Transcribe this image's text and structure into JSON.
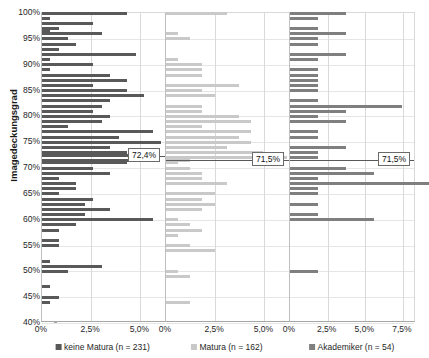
{
  "title": "",
  "chart_data": {
    "type": "bar",
    "orientation": "horizontal",
    "title": "",
    "ylabel": "Imagedeckungsgrad",
    "xlabel": "",
    "ylim": [
      40,
      100
    ],
    "y_ticks": [
      "40%",
      "45%",
      "50%",
      "55%",
      "60%",
      "65%",
      "70%",
      "75%",
      "80%",
      "85%",
      "90%",
      "95%",
      "100%"
    ],
    "grid": true,
    "legend_position": "bottom",
    "panels": [
      {
        "name": "keine Matura (n = 231)",
        "color": "#595959",
        "n": 231,
        "xlim": [
          0,
          6.25
        ],
        "x_ticks": [
          {
            "label": "0%",
            "value": 0
          },
          {
            "label": "2,5%",
            "value": 2.5
          },
          {
            "label": "5,0%",
            "value": 5.0
          }
        ],
        "mean_label": "72,4%",
        "mean_value": 72.4,
        "points": [
          {
            "y": 100.0,
            "v": 4.33
          },
          {
            "y": 99.0,
            "v": 0.43
          },
          {
            "y": 98.0,
            "v": 2.6
          },
          {
            "y": 97.0,
            "v": 0.87
          },
          {
            "y": 96.5,
            "v": 0.43
          },
          {
            "y": 96.0,
            "v": 3.03
          },
          {
            "y": 95.0,
            "v": 1.3
          },
          {
            "y": 94.0,
            "v": 1.73
          },
          {
            "y": 93.0,
            "v": 0.87
          },
          {
            "y": 92.0,
            "v": 4.76
          },
          {
            "y": 91.0,
            "v": 0.43
          },
          {
            "y": 90.0,
            "v": 2.6
          },
          {
            "y": 89.0,
            "v": 0.43
          },
          {
            "y": 88.0,
            "v": 3.46
          },
          {
            "y": 87.0,
            "v": 4.33
          },
          {
            "y": 86.0,
            "v": 2.6
          },
          {
            "y": 85.0,
            "v": 4.33
          },
          {
            "y": 84.0,
            "v": 5.19
          },
          {
            "y": 83.0,
            "v": 3.46
          },
          {
            "y": 82.0,
            "v": 3.03
          },
          {
            "y": 81.0,
            "v": 2.6
          },
          {
            "y": 80.0,
            "v": 3.46
          },
          {
            "y": 79.0,
            "v": 3.03
          },
          {
            "y": 78.0,
            "v": 1.3
          },
          {
            "y": 77.0,
            "v": 5.63
          },
          {
            "y": 76.0,
            "v": 3.9
          },
          {
            "y": 75.0,
            "v": 6.06
          },
          {
            "y": 74.0,
            "v": 3.46
          },
          {
            "y": 73.0,
            "v": 4.33
          },
          {
            "y": 72.4,
            "v": 4.76
          },
          {
            "y": 71.5,
            "v": 4.76
          },
          {
            "y": 71.0,
            "v": 4.33
          },
          {
            "y": 70.0,
            "v": 2.6
          },
          {
            "y": 69.0,
            "v": 3.46
          },
          {
            "y": 68.0,
            "v": 0.87
          },
          {
            "y": 67.0,
            "v": 1.73
          },
          {
            "y": 66.0,
            "v": 1.73
          },
          {
            "y": 65.0,
            "v": 0.87
          },
          {
            "y": 64.0,
            "v": 2.6
          },
          {
            "y": 63.0,
            "v": 2.16
          },
          {
            "y": 62.0,
            "v": 3.46
          },
          {
            "y": 61.0,
            "v": 2.16
          },
          {
            "y": 60.0,
            "v": 5.63
          },
          {
            "y": 59.0,
            "v": 1.73
          },
          {
            "y": 58.0,
            "v": 0.87
          },
          {
            "y": 56.0,
            "v": 0.87
          },
          {
            "y": 55.0,
            "v": 0.87
          },
          {
            "y": 52.0,
            "v": 0.43
          },
          {
            "y": 51.0,
            "v": 3.03
          },
          {
            "y": 50.0,
            "v": 1.3
          },
          {
            "y": 47.0,
            "v": 0.43
          },
          {
            "y": 45.0,
            "v": 0.87
          },
          {
            "y": 44.0,
            "v": 0.43
          }
        ]
      },
      {
        "name": "Matura (n = 162)",
        "color": "#c9c9c9",
        "n": 162,
        "xlim": [
          0,
          6.25
        ],
        "x_ticks": [
          {
            "label": "0%",
            "value": 0
          },
          {
            "label": "2,5%",
            "value": 2.5
          },
          {
            "label": "5,0%",
            "value": 5.0
          }
        ],
        "mean_label": "71,5%",
        "mean_value": 71.5,
        "points": [
          {
            "y": 100.0,
            "v": 3.09
          },
          {
            "y": 96.0,
            "v": 0.62
          },
          {
            "y": 95.0,
            "v": 1.23
          },
          {
            "y": 91.0,
            "v": 0.62
          },
          {
            "y": 90.0,
            "v": 1.85
          },
          {
            "y": 89.0,
            "v": 1.85
          },
          {
            "y": 88.0,
            "v": 1.85
          },
          {
            "y": 86.0,
            "v": 3.7
          },
          {
            "y": 85.0,
            "v": 1.85
          },
          {
            "y": 84.0,
            "v": 2.47
          },
          {
            "y": 82.0,
            "v": 1.85
          },
          {
            "y": 81.0,
            "v": 1.85
          },
          {
            "y": 80.0,
            "v": 3.7
          },
          {
            "y": 79.0,
            "v": 4.32
          },
          {
            "y": 78.0,
            "v": 1.85
          },
          {
            "y": 77.0,
            "v": 4.32
          },
          {
            "y": 76.0,
            "v": 3.7
          },
          {
            "y": 75.0,
            "v": 4.32
          },
          {
            "y": 74.0,
            "v": 3.09
          },
          {
            "y": 73.0,
            "v": 4.94
          },
          {
            "y": 72.0,
            "v": 6.17
          },
          {
            "y": 71.5,
            "v": 1.23
          },
          {
            "y": 71.0,
            "v": 0.62
          },
          {
            "y": 70.0,
            "v": 1.23
          },
          {
            "y": 69.0,
            "v": 1.85
          },
          {
            "y": 68.0,
            "v": 1.85
          },
          {
            "y": 67.0,
            "v": 3.09
          },
          {
            "y": 65.0,
            "v": 2.47
          },
          {
            "y": 64.0,
            "v": 1.85
          },
          {
            "y": 63.0,
            "v": 2.47
          },
          {
            "y": 62.0,
            "v": 1.85
          },
          {
            "y": 60.0,
            "v": 0.62
          },
          {
            "y": 59.0,
            "v": 1.23
          },
          {
            "y": 58.0,
            "v": 1.85
          },
          {
            "y": 57.0,
            "v": 0.62
          },
          {
            "y": 55.0,
            "v": 1.23
          },
          {
            "y": 54.0,
            "v": 2.47
          },
          {
            "y": 50.0,
            "v": 0.62
          },
          {
            "y": 49.0,
            "v": 1.23
          },
          {
            "y": 44.0,
            "v": 1.23
          }
        ]
      },
      {
        "name": "Akademiker (n = 54)",
        "color": "#7f7f7f",
        "n": 54,
        "xlim": [
          0,
          8.3
        ],
        "x_ticks": [
          {
            "label": "0%",
            "value": 0
          },
          {
            "label": "2,5%",
            "value": 2.5
          },
          {
            "label": "5,0%",
            "value": 5.0
          },
          {
            "label": "7,5%",
            "value": 7.5
          }
        ],
        "mean_label": "71,5%",
        "mean_value": 71.5,
        "points": [
          {
            "y": 100.0,
            "v": 3.7
          },
          {
            "y": 99.0,
            "v": 1.85
          },
          {
            "y": 97.0,
            "v": 1.85
          },
          {
            "y": 96.0,
            "v": 3.7
          },
          {
            "y": 95.0,
            "v": 1.85
          },
          {
            "y": 94.0,
            "v": 1.85
          },
          {
            "y": 92.0,
            "v": 3.7
          },
          {
            "y": 91.0,
            "v": 1.85
          },
          {
            "y": 89.0,
            "v": 1.85
          },
          {
            "y": 88.0,
            "v": 1.85
          },
          {
            "y": 87.0,
            "v": 1.85
          },
          {
            "y": 86.0,
            "v": 1.85
          },
          {
            "y": 85.0,
            "v": 1.85
          },
          {
            "y": 83.0,
            "v": 1.85
          },
          {
            "y": 82.0,
            "v": 7.41
          },
          {
            "y": 81.0,
            "v": 3.7
          },
          {
            "y": 80.0,
            "v": 1.85
          },
          {
            "y": 79.0,
            "v": 3.7
          },
          {
            "y": 77.0,
            "v": 1.85
          },
          {
            "y": 76.0,
            "v": 1.85
          },
          {
            "y": 74.0,
            "v": 3.7
          },
          {
            "y": 73.0,
            "v": 1.85
          },
          {
            "y": 72.0,
            "v": 1.85
          },
          {
            "y": 70.0,
            "v": 3.7
          },
          {
            "y": 69.0,
            "v": 5.56
          },
          {
            "y": 68.0,
            "v": 1.85
          },
          {
            "y": 67.0,
            "v": 9.26
          },
          {
            "y": 66.0,
            "v": 1.85
          },
          {
            "y": 65.0,
            "v": 1.85
          },
          {
            "y": 63.0,
            "v": 1.85
          },
          {
            "y": 61.0,
            "v": 1.85
          },
          {
            "y": 60.0,
            "v": 5.56
          },
          {
            "y": 50.0,
            "v": 1.85
          }
        ]
      }
    ]
  }
}
